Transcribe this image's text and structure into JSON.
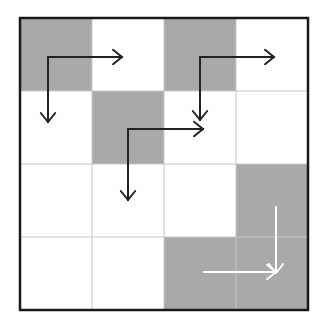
{
  "grid": {
    "rows": 4,
    "cols": 4,
    "origin": [
      20,
      18
    ],
    "cell_size": [
      72,
      73
    ],
    "shade_color": "#a9a9a9",
    "empty_color": "#ffffff",
    "gridline_color": "#c8c8c8",
    "border_color": "#1a1a1a",
    "shaded_cells": [
      [
        0,
        0
      ],
      [
        0,
        2
      ],
      [
        1,
        1
      ],
      [
        2,
        3
      ],
      [
        3,
        2
      ],
      [
        3,
        3
      ]
    ]
  },
  "arrows": [
    {
      "id": "arrow-1",
      "color": "#222222",
      "corner": [
        48,
        57
      ],
      "right_end": [
        122,
        57
      ],
      "down_end": [
        48,
        122
      ]
    },
    {
      "id": "arrow-2",
      "color": "#222222",
      "corner": [
        200,
        57
      ],
      "right_end": [
        274,
        57
      ],
      "down_end": [
        200,
        120
      ]
    },
    {
      "id": "arrow-3",
      "color": "#222222",
      "corner": [
        128,
        129
      ],
      "right_end": [
        203,
        129
      ],
      "down_end": [
        128,
        200
      ]
    },
    {
      "id": "arrow-4",
      "color": "#ffffff",
      "vertical": {
        "x": 276,
        "y1": 207,
        "y2": 273
      },
      "horizontal": {
        "y": 272,
        "x1": 204,
        "x2": 276
      }
    }
  ]
}
